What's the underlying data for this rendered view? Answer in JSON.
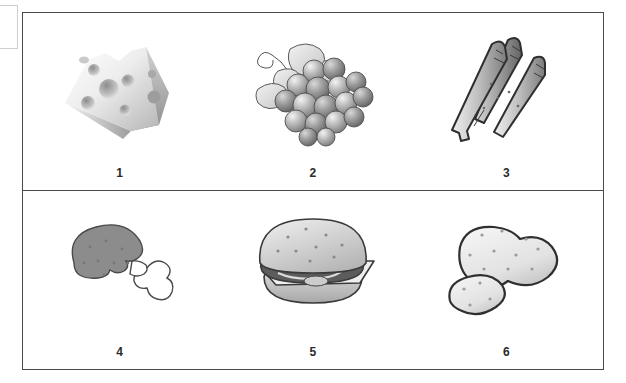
{
  "worksheet": {
    "title": "Food picture grid",
    "rows": [
      {
        "cells": [
          {
            "label": "1",
            "icon": "cheese-wedge-icon",
            "name": "cheese"
          },
          {
            "label": "2",
            "icon": "grapes-icon",
            "name": "grapes"
          },
          {
            "label": "3",
            "icon": "asparagus-icon",
            "name": "asparagus"
          }
        ]
      },
      {
        "cells": [
          {
            "label": "4",
            "icon": "chicken-drumstick-icon",
            "name": "chicken drumstick"
          },
          {
            "label": "5",
            "icon": "hamburger-icon",
            "name": "hamburger"
          },
          {
            "label": "6",
            "icon": "potatoes-icon",
            "name": "potatoes"
          }
        ]
      }
    ]
  },
  "colors": {
    "frame_border": "#4a4a4a",
    "background": "#ffffff",
    "label_text": "#2a2a2a",
    "art_outline": "#3a3a3a",
    "art_fill_light": "#e8e8e8",
    "art_fill_mid": "#b9b9b9",
    "art_fill_dark": "#7d7d7d",
    "scrap_border": "#cfcfcf"
  }
}
